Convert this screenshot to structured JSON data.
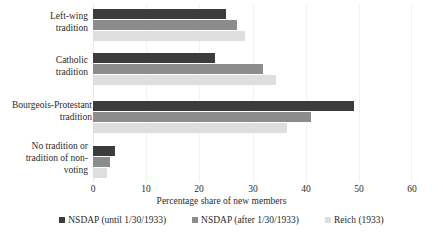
{
  "chart_data": {
    "type": "bar",
    "orientation": "horizontal",
    "title": "",
    "xlabel": "Percentage share of new members",
    "ylabel": "",
    "xlim": [
      0,
      60
    ],
    "xticks": [
      0,
      10,
      20,
      30,
      40,
      50,
      60
    ],
    "grid": true,
    "legend_position": "bottom",
    "categories": [
      "Left-wing tradition",
      "Catholic tradition",
      "Bourgeois-Protestant tradition",
      "No tradition or tradition of non-voting"
    ],
    "series": [
      {
        "name": "NSDAP (until 1/30/1933)",
        "color": "#3c3c3c",
        "values": [
          25.0,
          23.0,
          49.0,
          4.2
        ]
      },
      {
        "name": "NSDAP (after 1/30/1933)",
        "color": "#8c8c8c",
        "values": [
          27.0,
          32.0,
          41.0,
          3.2
        ]
      },
      {
        "name": "Reich (1933)",
        "color": "#dedede",
        "values": [
          28.5,
          34.5,
          36.5,
          2.6
        ]
      }
    ]
  },
  "axis": {
    "tick_0": "0",
    "tick_1": "10",
    "tick_2": "20",
    "tick_3": "30",
    "tick_4": "40",
    "tick_5": "50",
    "tick_6": "60",
    "title": "Percentage share of new members"
  },
  "categories": {
    "cat_0_line_0": "Left-wing",
    "cat_0_line_1": "tradition",
    "cat_1_line_0": "Catholic",
    "cat_1_line_1": "tradition",
    "cat_2_line_0": "Bourgeois-Protestant",
    "cat_2_line_1": "tradition",
    "cat_3_line_0": "No tradition or",
    "cat_3_line_1": "tradition of non-",
    "cat_3_line_2": "voting"
  },
  "legend": {
    "item_0": "NSDAP (until 1/30/1933)",
    "item_1": "NSDAP (after 1/30/1933)",
    "item_2": "Reich (1933)"
  }
}
